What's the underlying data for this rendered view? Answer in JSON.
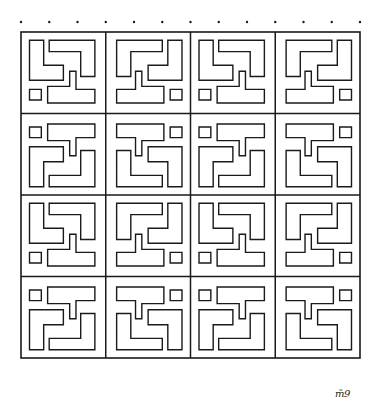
{
  "artwork": {
    "kind": "hand-drawn geometric maze pattern",
    "stroke_color": "#1a1a1a",
    "background": "#ffffff",
    "frame": {
      "x": 21,
      "y": 32,
      "w": 339,
      "h": 326
    },
    "grid": {
      "rows": 4,
      "cols": 4
    },
    "tick_dots_top_count": 13,
    "signature": "m̃9"
  }
}
